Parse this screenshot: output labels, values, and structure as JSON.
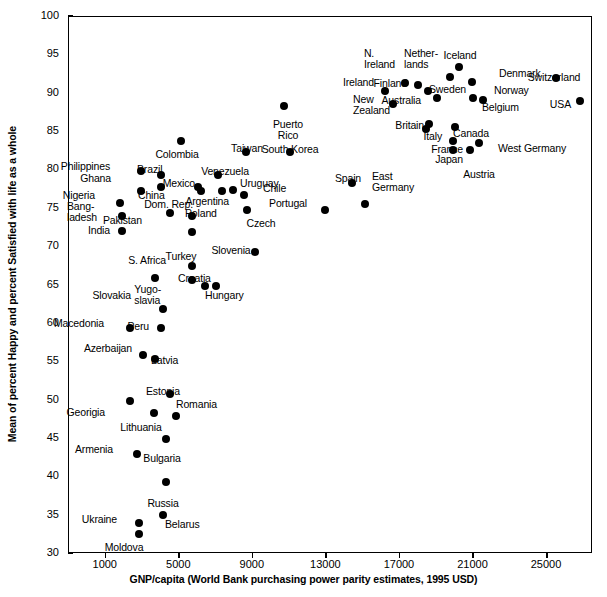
{
  "chart_data": {
    "type": "scatter",
    "title": "",
    "xlabel": "GNP/capita (World Bank purchasing power parity estimates, 1995 USD)",
    "ylabel": "Mean of percent Happy and percent Satisfied with life as a whole",
    "xlim": [
      -1000,
      27500
    ],
    "ylim": [
      30,
      100
    ],
    "grid": false,
    "legend": null,
    "xticks": [
      1000,
      5000,
      9000,
      13000,
      17000,
      21000,
      25000
    ],
    "yticks": [
      30,
      35,
      40,
      45,
      50,
      55,
      60,
      65,
      70,
      75,
      80,
      85,
      90,
      95,
      100
    ],
    "points": [
      {
        "label": "Puerto Rico",
        "x": 10700,
        "y": 88.4,
        "lx": 287,
        "ly": 118,
        "align": "center",
        "lines": [
          "Puerto",
          "Rico"
        ]
      },
      {
        "label": "Iceland",
        "x": 20200,
        "y": 93.5,
        "lx": 459,
        "ly": 49,
        "align": "center",
        "lines": [
          "Iceland"
        ]
      },
      {
        "label": "Switzerland",
        "x": 25500,
        "y": 92.0,
        "lx": 553,
        "ly": 71,
        "align": "center",
        "lines": [
          "Switzerland"
        ]
      },
      {
        "label": "Denmark",
        "x": 20900,
        "y": 91.5,
        "lx": 498,
        "ly": 72,
        "align": "left",
        "lines": [
          "Denmark"
        ]
      },
      {
        "label": "Netherlands",
        "x": 19700,
        "y": 92.2,
        "lx": 437,
        "ly": 57,
        "align": "right",
        "lines": [
          "Nether-",
          "lands"
        ]
      },
      {
        "label": "N. Ireland",
        "x": 17300,
        "y": 91.4,
        "lx": 394,
        "ly": 57,
        "align": "right",
        "lines": [
          "N.",
          "Ireland"
        ]
      },
      {
        "label": "Finland",
        "x": 18000,
        "y": 91.1,
        "lx": 406,
        "ly": 82,
        "align": "right",
        "lines": [
          "Finland"
        ]
      },
      {
        "label": "Sweden",
        "x": 18500,
        "y": 90.3,
        "lx": 428,
        "ly": 88,
        "align": "left",
        "lines": [
          "Sweden"
        ]
      },
      {
        "label": "Norway",
        "x": 21500,
        "y": 89.2,
        "lx": 493,
        "ly": 89,
        "align": "left",
        "lines": [
          "Norway"
        ]
      },
      {
        "label": "Belgium",
        "x": 21000,
        "y": 89.5,
        "lx": 481,
        "ly": 106,
        "align": "left",
        "lines": [
          "Belgium"
        ]
      },
      {
        "label": "Ireland",
        "x": 16200,
        "y": 90.3,
        "lx": 373,
        "ly": 81,
        "align": "right",
        "lines": [
          "Ireland"
        ]
      },
      {
        "label": "New Zealand",
        "x": 16600,
        "y": 88.6,
        "lx": 389,
        "ly": 103,
        "align": "right",
        "lines": [
          "New",
          "Zealand"
        ]
      },
      {
        "label": "Australia",
        "x": 19000,
        "y": 89.4,
        "lx": 420,
        "ly": 99,
        "align": "right",
        "lines": [
          "Australia"
        ]
      },
      {
        "label": "USA",
        "x": 26800,
        "y": 89.1,
        "lx": 570,
        "ly": 103,
        "align": "right",
        "lines": [
          "USA"
        ]
      },
      {
        "label": "Britain",
        "x": 18600,
        "y": 86.1,
        "lx": 423,
        "ly": 124,
        "align": "right",
        "lines": [
          "Britain"
        ]
      },
      {
        "label": "Canada",
        "x": 20000,
        "y": 85.7,
        "lx": 470,
        "ly": 127,
        "align": "center",
        "lines": [
          "Canada"
        ]
      },
      {
        "label": "Italy",
        "x": 18400,
        "y": 85.4,
        "lx": 441,
        "ly": 135,
        "align": "right",
        "lines": [
          "Italy"
        ]
      },
      {
        "label": "West Germany",
        "x": 21300,
        "y": 83.6,
        "lx": 497,
        "ly": 147,
        "align": "left",
        "lines": [
          "West Germany"
        ]
      },
      {
        "label": "France",
        "x": 19900,
        "y": 83.9,
        "lx": 462,
        "ly": 148,
        "align": "right",
        "lines": [
          "France"
        ]
      },
      {
        "label": "Japan",
        "x": 19900,
        "y": 82.7,
        "lx": 462,
        "ly": 158,
        "align": "right",
        "lines": [
          "Japan"
        ]
      },
      {
        "label": "Austria",
        "x": 20800,
        "y": 82.6,
        "lx": 478,
        "ly": 168,
        "align": "center",
        "lines": [
          "Austria"
        ]
      },
      {
        "label": "Taiwan",
        "x": 8600,
        "y": 82.4,
        "lx": 246,
        "ly": 142,
        "align": "center",
        "lines": [
          "Taiwan"
        ]
      },
      {
        "label": "South Korea",
        "x": 11000,
        "y": 82.4,
        "lx": 289,
        "ly": 143,
        "align": "center",
        "lines": [
          "South Korea"
        ]
      },
      {
        "label": "Colombia",
        "x": 5100,
        "y": 83.8,
        "lx": 176,
        "ly": 148,
        "align": "center",
        "lines": [
          "Colombia"
        ]
      },
      {
        "label": "Philippines",
        "x": 2900,
        "y": 79.9,
        "lx": 109,
        "ly": 165,
        "align": "right",
        "lines": [
          "Philippines"
        ]
      },
      {
        "label": "Brazil",
        "x": 4000,
        "y": 79.4,
        "lx": 136,
        "ly": 168,
        "align": "left",
        "lines": [
          "Brazil"
        ]
      },
      {
        "label": "Venezuela",
        "x": 7100,
        "y": 79.4,
        "lx": 224,
        "ly": 165,
        "align": "center",
        "lines": [
          "Venezuela"
        ]
      },
      {
        "label": "Ghana",
        "x": 2900,
        "y": 77.3,
        "lx": 110,
        "ly": 177,
        "align": "right",
        "lines": [
          "Ghana"
        ]
      },
      {
        "label": "China",
        "x": 4000,
        "y": 77.9,
        "lx": 137,
        "ly": 194,
        "align": "left",
        "lines": [
          "China"
        ]
      },
      {
        "label": "Mexico",
        "x": 6200,
        "y": 77.3,
        "lx": 194,
        "ly": 182,
        "align": "right",
        "lines": [
          "Mexico"
        ]
      },
      {
        "label": "Uruguay",
        "x": 7300,
        "y": 77.3,
        "lx": 239,
        "ly": 182,
        "align": "left",
        "lines": [
          "Uruguay"
        ]
      },
      {
        "label": "Chile",
        "x": 8500,
        "y": 76.8,
        "lx": 262,
        "ly": 187,
        "align": "left",
        "lines": [
          "Chile"
        ]
      },
      {
        "label": "Dom. Rep.",
        "x": 6000,
        "y": 77.8,
        "lx": 192,
        "ly": 203,
        "align": "right",
        "lines": [
          "Dom. Rep."
        ]
      },
      {
        "label": "Argentina",
        "x": 7900,
        "y": 77.4,
        "lx": 228,
        "ly": 200,
        "align": "right",
        "lines": [
          "Argentina"
        ]
      },
      {
        "label": "Nigeria",
        "x": 1800,
        "y": 75.8,
        "lx": 94,
        "ly": 194,
        "align": "right",
        "lines": [
          "Nigeria"
        ]
      },
      {
        "label": "Spain",
        "x": 14400,
        "y": 78.3,
        "lx": 347,
        "ly": 172,
        "align": "center",
        "lines": [
          "Spain"
        ]
      },
      {
        "label": "East Germany",
        "x": 15100,
        "y": 75.6,
        "lx": 371,
        "ly": 180,
        "align": "left",
        "lines": [
          "East",
          "Germany"
        ]
      },
      {
        "label": "Portugal",
        "x": 12900,
        "y": 74.8,
        "lx": 306,
        "ly": 202,
        "align": "right",
        "lines": [
          "Portugal"
        ]
      },
      {
        "label": "Czech",
        "x": 8700,
        "y": 74.9,
        "lx": 260,
        "ly": 217,
        "align": "center",
        "lines": [
          "Czech"
        ]
      },
      {
        "label": "Bangladesh",
        "x": 1900,
        "y": 74.0,
        "lx": 96,
        "ly": 210,
        "align": "right",
        "lines": [
          "Bang-",
          "ladesh"
        ]
      },
      {
        "label": "Pakistan",
        "x": 4500,
        "y": 74.5,
        "lx": 141,
        "ly": 219,
        "align": "right",
        "lines": [
          "Pakistan"
        ]
      },
      {
        "label": "Poland",
        "x": 5700,
        "y": 74.0,
        "lx": 184,
        "ly": 212,
        "align": "left",
        "lines": [
          "Poland"
        ]
      },
      {
        "label": "India",
        "x": 1900,
        "y": 72.1,
        "lx": 109,
        "ly": 229,
        "align": "right",
        "lines": [
          "India"
        ]
      },
      {
        "label": "Turkey",
        "x": 5700,
        "y": 72.0,
        "lx": 180,
        "ly": 250,
        "align": "center",
        "lines": [
          "Turkey"
        ]
      },
      {
        "label": "Slovenia",
        "x": 9100,
        "y": 69.4,
        "lx": 230,
        "ly": 244,
        "align": "center",
        "lines": [
          "Slovenia"
        ]
      },
      {
        "label": "S. Africa",
        "x": 5700,
        "y": 67.5,
        "lx": 165,
        "ly": 259,
        "align": "right",
        "lines": [
          "S. Africa"
        ]
      },
      {
        "label": "Slovakia",
        "x": 3700,
        "y": 66.0,
        "lx": 130,
        "ly": 294,
        "align": "right",
        "lines": [
          "Slovakia"
        ]
      },
      {
        "label": "Croatia",
        "x": 5700,
        "y": 65.7,
        "lx": 177,
        "ly": 277,
        "align": "left",
        "lines": [
          "Croatia"
        ]
      },
      {
        "label": "Yugoslavia",
        "x": 6400,
        "y": 65.0,
        "lx": 160,
        "ly": 293,
        "align": "right",
        "lines": [
          "Yugo-",
          "slavia"
        ]
      },
      {
        "label": "Hungary",
        "x": 7000,
        "y": 64.9,
        "lx": 204,
        "ly": 294,
        "align": "left",
        "lines": [
          "Hungary"
        ]
      },
      {
        "label": "Peru",
        "x": 4100,
        "y": 61.9,
        "lx": 148,
        "ly": 325,
        "align": "right",
        "lines": [
          "Peru"
        ]
      },
      {
        "label": "Macedonia",
        "x": 2300,
        "y": 59.4,
        "lx": 103,
        "ly": 322,
        "align": "right",
        "lines": [
          "Macedonia"
        ]
      },
      {
        "label": "Peru2",
        "x": 4000,
        "y": 59.5,
        "lx": 0,
        "ly": 0,
        "align": "none",
        "lines": []
      },
      {
        "label": "Azerbaijan",
        "x": 3000,
        "y": 55.9,
        "lx": 131,
        "ly": 347,
        "align": "right",
        "lines": [
          "Azerbaijan"
        ]
      },
      {
        "label": "Latvia",
        "x": 3700,
        "y": 55.4,
        "lx": 150,
        "ly": 359,
        "align": "left",
        "lines": [
          "Latvia"
        ]
      },
      {
        "label": "Estonia",
        "x": 4500,
        "y": 50.9,
        "lx": 162,
        "ly": 385,
        "align": "center",
        "lines": [
          "Estonia"
        ]
      },
      {
        "label": "Georgia",
        "x": 2300,
        "y": 50.0,
        "lx": 104,
        "ly": 411,
        "align": "right",
        "lines": [
          "Georigia"
        ]
      },
      {
        "label": "Lithuania",
        "x": 3600,
        "y": 48.4,
        "lx": 140,
        "ly": 421,
        "align": "center",
        "lines": [
          "Lithuania"
        ]
      },
      {
        "label": "Romania",
        "x": 4800,
        "y": 48.0,
        "lx": 175,
        "ly": 403,
        "align": "left",
        "lines": [
          "Romania"
        ]
      },
      {
        "label": "Bulgaria",
        "x": 4300,
        "y": 45.0,
        "lx": 161,
        "ly": 452,
        "align": "center",
        "lines": [
          "Bulgaria"
        ]
      },
      {
        "label": "Armenia",
        "x": 2700,
        "y": 43.1,
        "lx": 112,
        "ly": 448,
        "align": "right",
        "lines": [
          "Armenia"
        ]
      },
      {
        "label": "Russia",
        "x": 4300,
        "y": 39.4,
        "lx": 162,
        "ly": 497,
        "align": "center",
        "lines": [
          "Russia"
        ]
      },
      {
        "label": "Belarus",
        "x": 4100,
        "y": 35.1,
        "lx": 164,
        "ly": 523,
        "align": "left",
        "lines": [
          "Belarus"
        ]
      },
      {
        "label": "Ukraine",
        "x": 2800,
        "y": 34.1,
        "lx": 116,
        "ly": 518,
        "align": "right",
        "lines": [
          "Ukraine"
        ]
      },
      {
        "label": "Moldova",
        "x": 2800,
        "y": 32.6,
        "lx": 123,
        "ly": 541,
        "align": "center",
        "lines": [
          "Moldova"
        ]
      }
    ]
  },
  "axes": {
    "x_tick_labels": [
      "1000",
      "5000",
      "9000",
      "13000",
      "17000",
      "21000",
      "25000"
    ],
    "y_tick_labels": [
      "100",
      "95",
      "90",
      "85",
      "80",
      "75",
      "70",
      "65",
      "60",
      "55",
      "50",
      "45",
      "40",
      "35",
      "30"
    ],
    "x_title": "GNP/capita (World Bank purchasing power parity estimates, 1995 USD)",
    "y_title": "Mean of percent Happy and percent Satisfied with life as a whole"
  },
  "colors": {
    "marker": "#000000",
    "axis": "#000000",
    "background": "#ffffff"
  }
}
